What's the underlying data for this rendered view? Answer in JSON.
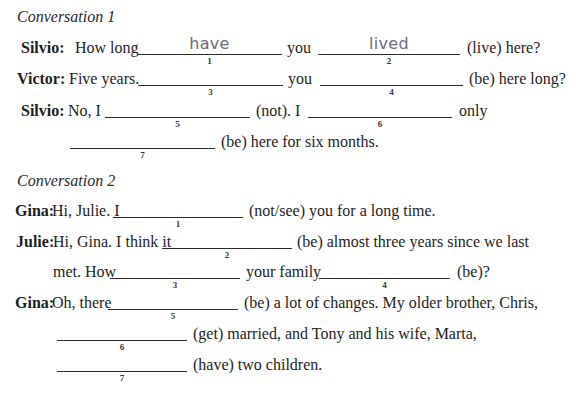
{
  "conversation1": {
    "heading": "Conversation 1",
    "lines": [
      {
        "speaker": "Silvio:",
        "t1": "How long",
        "blank1": {
          "num": "1",
          "answer": "have"
        },
        "t2": "you",
        "blank2": {
          "num": "2",
          "answer": "lived"
        },
        "t3": "(live) here?"
      },
      {
        "speaker": "Victor:",
        "t1": "Five years.",
        "blank1": {
          "num": "3",
          "answer": ""
        },
        "t2": "you",
        "blank2": {
          "num": "4",
          "answer": ""
        },
        "t3": "(be) here long?"
      },
      {
        "speaker": "Silvio:",
        "t1": "No, I",
        "blank1": {
          "num": "5",
          "answer": ""
        },
        "t2": "(not). I",
        "blank2": {
          "num": "6",
          "answer": ""
        },
        "t3": "only"
      },
      {
        "blank1": {
          "num": "7",
          "answer": ""
        },
        "t1": "(be) here for six months."
      }
    ]
  },
  "conversation2": {
    "heading": "Conversation 2",
    "lines": [
      {
        "speaker": "Gina:",
        "t1": "Hi, Julie. I",
        "blank1": {
          "num": "1",
          "answer": ""
        },
        "t2": "(not/see) you for a long time."
      },
      {
        "speaker": "Julie:",
        "t1": "Hi, Gina. I think it",
        "blank1": {
          "num": "2",
          "answer": ""
        },
        "t2": "(be) almost three years since we last"
      },
      {
        "t1": "met. How",
        "blank1": {
          "num": "3",
          "answer": ""
        },
        "t2": "your family",
        "blank2": {
          "num": "4",
          "answer": ""
        },
        "t3": "(be)?"
      },
      {
        "speaker": "Gina:",
        "t1": "Oh, there",
        "blank1": {
          "num": "5",
          "answer": ""
        },
        "t2": "(be) a lot of changes. My older brother, Chris,"
      },
      {
        "blank1": {
          "num": "6",
          "answer": ""
        },
        "t1": "(get) married, and Tony and his wife, Marta,"
      },
      {
        "blank1": {
          "num": "7",
          "answer": ""
        },
        "t1": "(have) two children."
      }
    ]
  }
}
